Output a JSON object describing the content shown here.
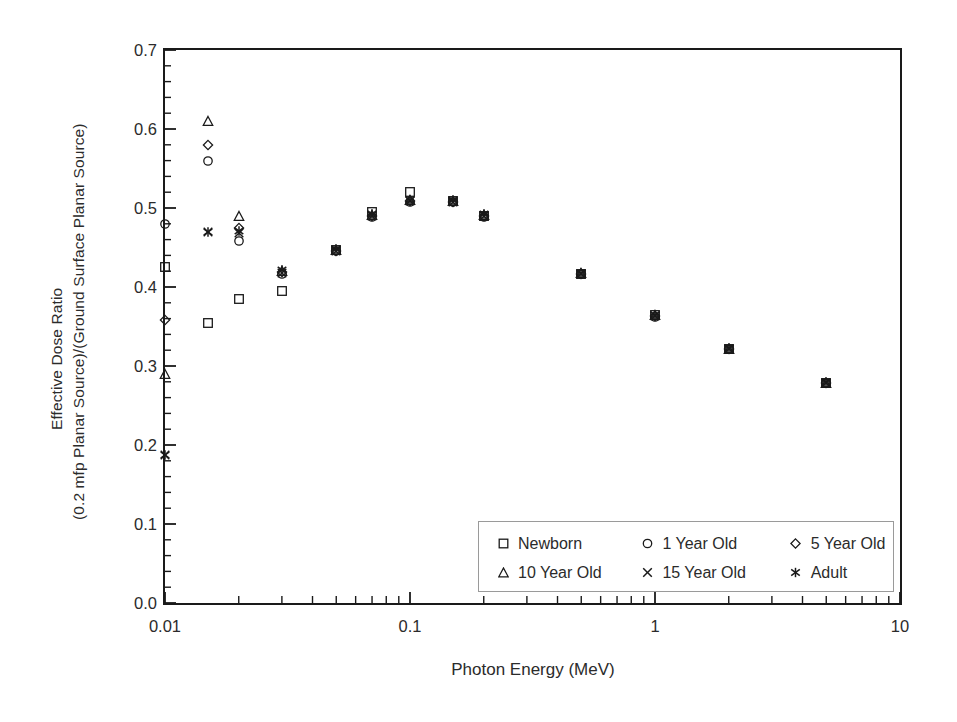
{
  "chart_data": {
    "type": "scatter",
    "title": "",
    "xlabel": "Photon Energy (MeV)",
    "ylabel_line1": "Effective Dose Ratio",
    "ylabel_line2": "(0.2 mfp Planar Source)/(Ground Surface Planar Source)",
    "xscale": "log",
    "yscale": "linear",
    "xlim": [
      0.01,
      10
    ],
    "ylim": [
      0.0,
      0.7
    ],
    "grid": false,
    "legend_position": "lower-right",
    "xticks": [
      {
        "value": 0.01,
        "label": "0.01"
      },
      {
        "value": 0.1,
        "label": "0.1"
      },
      {
        "value": 1,
        "label": "1"
      },
      {
        "value": 10,
        "label": "10"
      }
    ],
    "yticks": [
      {
        "value": 0.0,
        "label": "0.0"
      },
      {
        "value": 0.1,
        "label": "0.1"
      },
      {
        "value": 0.2,
        "label": "0.2"
      },
      {
        "value": 0.3,
        "label": "0.3"
      },
      {
        "value": 0.4,
        "label": "0.4"
      },
      {
        "value": 0.5,
        "label": "0.5"
      },
      {
        "value": 0.6,
        "label": "0.6"
      },
      {
        "value": 0.7,
        "label": "0.7"
      }
    ],
    "x": [
      0.01,
      0.015,
      0.02,
      0.03,
      0.05,
      0.07,
      0.1,
      0.15,
      0.2,
      0.5,
      1,
      2,
      5
    ],
    "series": [
      {
        "name": "Newborn",
        "marker": "square",
        "values": [
          0.425,
          0.355,
          0.385,
          0.395,
          0.447,
          0.495,
          0.52,
          0.509,
          0.49,
          0.417,
          0.364,
          0.322,
          0.279
        ]
      },
      {
        "name": "1 Year Old",
        "marker": "circle",
        "values": [
          0.48,
          0.56,
          0.458,
          0.417,
          0.445,
          0.489,
          0.508,
          0.507,
          0.489,
          0.416,
          0.362,
          0.321,
          0.278
        ]
      },
      {
        "name": "5 Year Old",
        "marker": "diamond",
        "values": [
          0.358,
          0.58,
          0.475,
          0.419,
          0.446,
          0.49,
          0.509,
          0.508,
          0.49,
          0.417,
          0.363,
          0.322,
          0.279
        ]
      },
      {
        "name": "10 Year Old",
        "marker": "triangle",
        "values": [
          0.29,
          0.61,
          0.49,
          0.42,
          0.447,
          0.491,
          0.51,
          0.509,
          0.491,
          0.418,
          0.364,
          0.322,
          0.279
        ]
      },
      {
        "name": "15 Year Old",
        "marker": "cross",
        "values": [
          0.187,
          0.47,
          0.468,
          0.418,
          0.446,
          0.49,
          0.509,
          0.508,
          0.49,
          0.417,
          0.363,
          0.322,
          0.279
        ]
      },
      {
        "name": "Adult",
        "marker": "asterisk",
        "values": [
          0.187,
          0.47,
          0.471,
          0.421,
          0.448,
          0.492,
          0.51,
          0.51,
          0.492,
          0.418,
          0.365,
          0.323,
          0.28
        ]
      }
    ]
  },
  "legend": {
    "entries": [
      {
        "label": "Newborn",
        "marker": "square"
      },
      {
        "label": "1 Year Old",
        "marker": "circle"
      },
      {
        "label": "5 Year Old",
        "marker": "diamond"
      },
      {
        "label": "10 Year Old",
        "marker": "triangle"
      },
      {
        "label": "15 Year Old",
        "marker": "cross"
      },
      {
        "label": "Adult",
        "marker": "asterisk"
      }
    ]
  },
  "colors": {
    "axis": "#1a1a1a",
    "marker": "#1a1a1a",
    "text": "#2b2b2b",
    "legend_border": "#9a9a9a",
    "background": "#ffffff"
  }
}
